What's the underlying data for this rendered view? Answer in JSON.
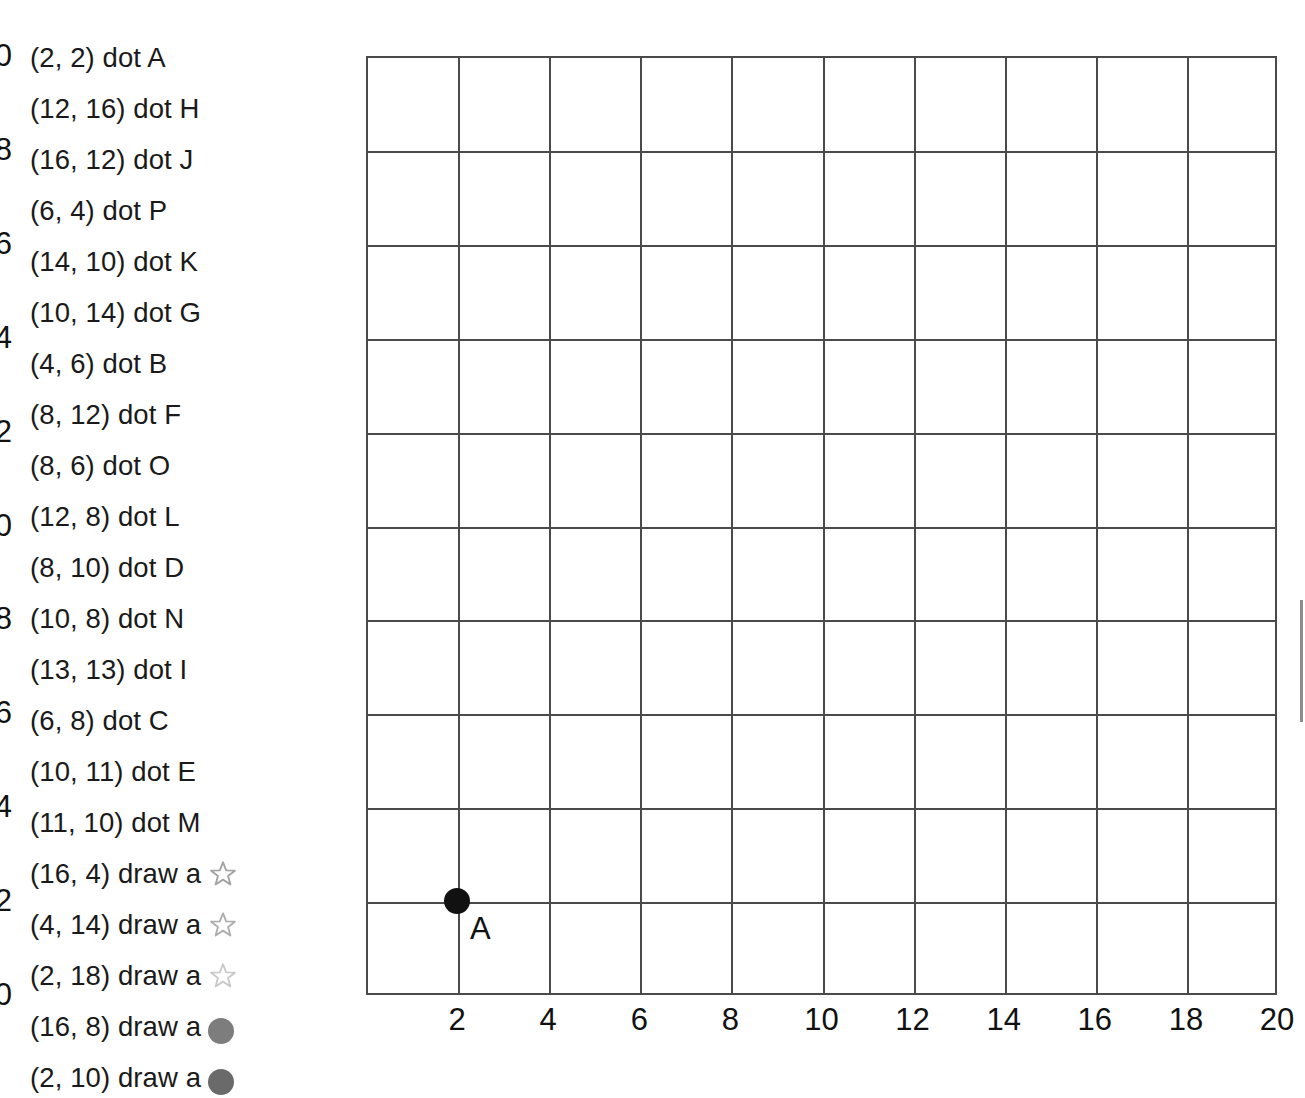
{
  "instructions": [
    {
      "text": "(2, 2) dot A",
      "symbol": null
    },
    {
      "text": "(12, 16) dot H",
      "symbol": null
    },
    {
      "text": "(16, 12) dot J",
      "symbol": null
    },
    {
      "text": "(6, 4) dot P",
      "symbol": null
    },
    {
      "text": "(14, 10) dot K",
      "symbol": null
    },
    {
      "text": "(10, 14) dot G",
      "symbol": null
    },
    {
      "text": "(4, 6) dot B",
      "symbol": null
    },
    {
      "text": "(8, 12) dot F",
      "symbol": null
    },
    {
      "text": "(8, 6) dot O",
      "symbol": null
    },
    {
      "text": "(12, 8) dot L",
      "symbol": null
    },
    {
      "text": "(8, 10) dot D",
      "symbol": null
    },
    {
      "text": "(10, 8) dot N",
      "symbol": null
    },
    {
      "text": "(13, 13) dot I",
      "symbol": null
    },
    {
      "text": "(6, 8) dot C",
      "symbol": null
    },
    {
      "text": "(10, 11) dot E",
      "symbol": null
    },
    {
      "text": "(11, 10) dot M",
      "symbol": null
    },
    {
      "text": "(16, 4) draw a",
      "symbol": {
        "kind": "star-outline-icon",
        "color": "#a3a3a3"
      }
    },
    {
      "text": "(4, 14) draw a",
      "symbol": {
        "kind": "star-outline-icon",
        "color": "#aeaeae"
      }
    },
    {
      "text": "(2, 18) draw a",
      "symbol": {
        "kind": "star-outline-icon",
        "color": "#c9c9c9"
      }
    },
    {
      "text": "(16, 8) draw a",
      "symbol": {
        "kind": "circle-filled-icon",
        "color": "#7d7d7d"
      }
    },
    {
      "text": "(2, 10) draw a",
      "symbol": {
        "kind": "circle-filled-icon",
        "color": "#6a6a6a"
      }
    }
  ],
  "chart_data": {
    "type": "scatter",
    "title": "",
    "xlabel": "",
    "ylabel": "",
    "xlim": [
      0,
      20
    ],
    "ylim": [
      0,
      20
    ],
    "grid": true,
    "grid_step": 2,
    "legend": "none",
    "xticks": [
      0,
      2,
      4,
      6,
      8,
      10,
      12,
      14,
      16,
      18,
      20
    ],
    "xtick_labels": [
      "",
      "2",
      "4",
      "6",
      "8",
      "10",
      "12",
      "14",
      "16",
      "18",
      "20"
    ],
    "yticks": [
      0,
      2,
      4,
      6,
      8,
      10,
      12,
      14,
      16,
      18,
      20
    ],
    "ytick_labels": [
      "0",
      "2",
      "4",
      "6",
      "8",
      "10",
      "12",
      "14",
      "16",
      "18",
      "20"
    ],
    "points": [
      {
        "label": "A",
        "x": 2,
        "y": 2,
        "marker": "circle-filled",
        "color": "#111111"
      }
    ]
  },
  "colors": {
    "axis": "#4a4a4a",
    "grid": "#4a4a4a",
    "text": "#1a1a1a",
    "point": "#111111",
    "scroll_artifact": "#8d8d8d"
  }
}
